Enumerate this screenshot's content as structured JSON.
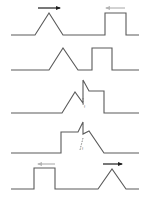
{
  "diagram": {
    "colors": {
      "wave": "#5a5a5a",
      "arrow_right": "#1e1e1e",
      "arrow_left": "#b5b5b5",
      "background": "#ffffff"
    },
    "panels": [
      {
        "id": "panel-1",
        "description": "Triangle pulse moving right, square pulse moving left, separated",
        "baseline_y": 35,
        "points": "11,35 35,35 49,13 63,35 105,35 105,13 126,13 126,35 139,35",
        "arrows": [
          {
            "direction": "right",
            "x1": 38,
            "x2": 60,
            "y": 8,
            "color": "#1e1e1e"
          },
          {
            "direction": "left",
            "x1": 125,
            "x2": 105,
            "y": 8,
            "color": "#b5b5b5"
          }
        ]
      },
      {
        "id": "panel-2",
        "description": "Pulses approaching each other",
        "baseline_y": 70,
        "points": "11,70 49,70 63,48 78,70 92,70 92,48 112,48 112,70 139,70",
        "arrows": []
      },
      {
        "id": "panel-3",
        "description": "Pulses beginning to overlap",
        "baseline_y": 113,
        "points": "11,113 62,113 75,92 83,103 83,80 89,91 104,91 104,113 139,113",
        "dashed": "83,98 83,106",
        "label": "f",
        "arrows": []
      },
      {
        "id": "panel-4",
        "description": "Pulses overlapping further",
        "baseline_y": 153,
        "points": "11,153 61,153 61,132 78,132 83,122 83,134 89,131 104,153 139,153",
        "dashed": "83,138 80,150",
        "label": "f",
        "arrows": []
      },
      {
        "id": "panel-5",
        "description": "Pulses have passed through each other, square moving left, triangle moving right",
        "baseline_y": 189,
        "points": "11,189 34,189 34,168 55,168 55,189 98,189 112,169 126,189 139,189",
        "arrows": [
          {
            "direction": "left",
            "x1": 55,
            "x2": 37,
            "y": 164,
            "color": "#b5b5b5"
          },
          {
            "direction": "right",
            "x1": 103,
            "x2": 123,
            "y": 164,
            "color": "#1e1e1e"
          }
        ]
      }
    ]
  }
}
